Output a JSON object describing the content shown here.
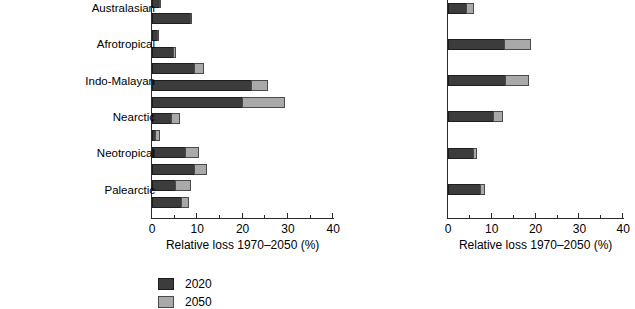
{
  "chart_data": [
    {
      "type": "bar",
      "orientation": "horizontal",
      "stacked": true,
      "panel_id": "biomes",
      "title": "",
      "xlabel": "Relative loss 1970–2050 (%)",
      "ylabel": "",
      "xlim": [
        0,
        40
      ],
      "xticks": [
        0,
        10,
        20,
        30,
        40
      ],
      "xtick_labels": [
        "0",
        "10",
        "20",
        "30",
        "40"
      ],
      "minor_ticks": [
        5,
        15,
        25,
        35
      ],
      "grid": false,
      "categories": [
        "Tundra",
        "Wooded tundra",
        "Boreal forest",
        "Cool conifer",
        "Temperate mixed forest",
        "Temperate deciduous forest",
        "Warm mixed forest",
        "Grassland/steppe",
        "Hot desert",
        "Shrub",
        "Savanna",
        "Tropical woodland",
        "Tropical forest"
      ],
      "series": [
        {
          "name": "2020",
          "color": "#3c3c3c",
          "values": [
            1.8,
            8.6,
            1.3,
            4.8,
            9.5,
            22.1,
            20.1,
            4.4,
            0.9,
            7.5,
            9.5,
            5.3,
            6.6
          ]
        },
        {
          "name": "2050",
          "color": "#a9a9a9",
          "values": [
            0.3,
            0.3,
            0.2,
            0.7,
            2.2,
            3.7,
            9.5,
            2.0,
            1.1,
            3.1,
            2.9,
            3.5,
            1.8
          ]
        }
      ],
      "totals": [
        2.1,
        8.9,
        1.5,
        5.5,
        11.7,
        25.8,
        29.6,
        6.4,
        2.0,
        10.6,
        12.4,
        8.8,
        8.4
      ]
    },
    {
      "type": "bar",
      "orientation": "horizontal",
      "stacked": true,
      "panel_id": "realms",
      "title": "",
      "xlabel": "Relative loss 1970–2050 (%)",
      "ylabel": "",
      "xlim": [
        0,
        40
      ],
      "xticks": [
        0,
        10,
        20,
        30,
        40
      ],
      "xtick_labels": [
        "0",
        "10",
        "20",
        "30",
        "40"
      ],
      "minor_ticks": [
        5,
        15,
        25,
        35
      ],
      "grid": false,
      "categories": [
        "Australasian",
        "Afrotropical",
        "Indo-Malayan",
        "Nearctic",
        "Neotropical",
        "Palearctic"
      ],
      "series": [
        {
          "name": "2020",
          "color": "#3c3c3c",
          "values": [
            4.3,
            13.0,
            13.2,
            10.5,
            5.9,
            7.5
          ]
        },
        {
          "name": "2050",
          "color": "#a9a9a9",
          "values": [
            1.9,
            6.2,
            5.5,
            2.4,
            0.9,
            1.2
          ]
        }
      ],
      "totals": [
        6.2,
        19.2,
        18.7,
        12.9,
        6.8,
        8.7
      ]
    }
  ],
  "panels": {
    "left": {
      "axis_title": "Relative loss 1970–2050 (%)",
      "tick_labels": [
        "0",
        "10",
        "20",
        "30",
        "40"
      ],
      "categories": [
        {
          "label": "Tundra",
          "v2020": 1.8,
          "v2050": 2.1
        },
        {
          "label": "Wooded tundra",
          "v2020": 8.6,
          "v2050": 8.9
        },
        {
          "label": "Boreal forest",
          "v2020": 1.3,
          "v2050": 1.5
        },
        {
          "label": "Cool conifer",
          "v2020": 4.8,
          "v2050": 5.5
        },
        {
          "label": "Temperate mixed forest",
          "v2020": 9.5,
          "v2050": 11.7
        },
        {
          "label": "Temperate deciduous forest",
          "v2020": 22.1,
          "v2050": 25.8
        },
        {
          "label": "Warm mixed forest",
          "v2020": 20.1,
          "v2050": 29.6
        },
        {
          "label": "Grassland/steppe",
          "v2020": 4.4,
          "v2050": 6.4
        },
        {
          "label": "Hot desert",
          "v2020": 0.9,
          "v2050": 2.0
        },
        {
          "label": "Shrub",
          "v2020": 7.5,
          "v2050": 10.6
        },
        {
          "label": "Savanna",
          "v2020": 9.5,
          "v2050": 12.4
        },
        {
          "label": "Tropical woodland",
          "v2020": 5.3,
          "v2050": 8.8
        },
        {
          "label": "Tropical forest",
          "v2020": 6.6,
          "v2050": 8.4
        }
      ]
    },
    "right": {
      "axis_title": "Relative loss 1970–2050 (%)",
      "tick_labels": [
        "0",
        "10",
        "20",
        "30",
        "40"
      ],
      "categories": [
        {
          "label": "Australasian",
          "v2020": 4.3,
          "v2050": 6.2
        },
        {
          "label": "Afrotropical",
          "v2020": 13.0,
          "v2050": 19.2
        },
        {
          "label": "Indo-Malayan",
          "v2020": 13.2,
          "v2050": 18.7
        },
        {
          "label": "Nearctic",
          "v2020": 10.5,
          "v2050": 12.9
        },
        {
          "label": "Neotropical",
          "v2020": 5.9,
          "v2050": 6.8
        },
        {
          "label": "Palearctic",
          "v2020": 7.5,
          "v2050": 8.7
        }
      ]
    }
  },
  "legend": {
    "items": [
      {
        "label": "2020",
        "color": "#3c3c3c"
      },
      {
        "label": "2050",
        "color": "#a9a9a9"
      }
    ]
  }
}
